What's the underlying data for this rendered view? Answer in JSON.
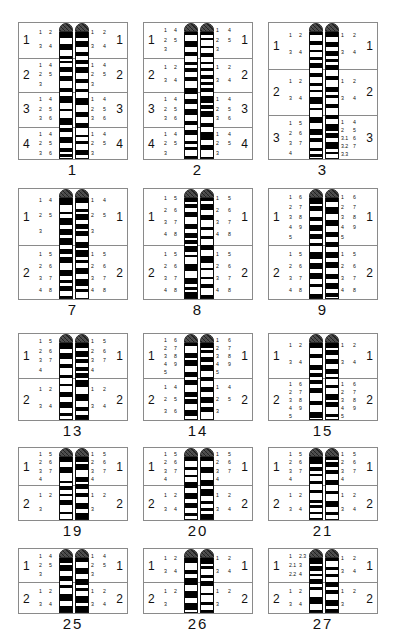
{
  "figure": {
    "type": "karyotype-ideogram-grid",
    "rows": 5,
    "columns": 3,
    "colors": {
      "band_dark": "#000000",
      "band_light": "#ffffff",
      "centromere_cap": "#4a4a4a",
      "panel_border": "#8a8a8a",
      "text": "#111111",
      "background": "#ffffff"
    }
  },
  "chromosomes": [
    {
      "id": "chr1",
      "caption": "1",
      "row": 0,
      "col": 0,
      "regions": [
        "1",
        "2",
        "3",
        "4"
      ],
      "left_band_labels": [
        [
          "1",
          "2",
          "3",
          "4"
        ],
        [
          "1",
          "2",
          "3",
          "4",
          "5"
        ],
        [
          "1",
          "2",
          "3",
          "4",
          "5",
          "6"
        ],
        [
          "1",
          "2",
          "3",
          "4",
          "5",
          "6"
        ]
      ],
      "right_band_labels": [
        [
          "1",
          "2",
          "3",
          "4"
        ],
        [
          "1",
          "2",
          "3",
          "4",
          "5"
        ],
        [
          "1",
          "2",
          "3",
          "4",
          "5",
          "6"
        ],
        [
          "1",
          "2",
          "3",
          "4",
          "5"
        ]
      ]
    },
    {
      "id": "chr2",
      "caption": "2",
      "row": 0,
      "col": 1,
      "regions": [
        "1",
        "2",
        "3",
        "4"
      ],
      "left_band_labels": [
        [
          "1",
          "2",
          "3",
          "4",
          "5"
        ],
        [
          "1",
          "2",
          "3",
          "4"
        ],
        [
          "1",
          "2",
          "3",
          "4",
          "5",
          "6"
        ],
        [
          "1",
          "2",
          "3",
          "4",
          "5"
        ]
      ],
      "right_band_labels": [
        [
          "1",
          "2",
          "3",
          "4",
          "5"
        ],
        [
          "1",
          "2",
          "3",
          "4"
        ],
        [
          "1",
          "2",
          "3",
          "4",
          "5",
          "6"
        ],
        [
          "1",
          "2",
          "3",
          "4",
          "5"
        ]
      ]
    },
    {
      "id": "chr3",
      "caption": "3",
      "row": 0,
      "col": 2,
      "regions": [
        "1",
        "2",
        "3"
      ],
      "left_band_labels": [
        [
          "1",
          "2",
          "3",
          "4"
        ],
        [
          "1",
          "2",
          "3",
          "4"
        ],
        [
          "1",
          "2",
          "3",
          "4",
          "5",
          "6",
          "7"
        ]
      ],
      "right_band_labels": [
        [
          "1",
          "2",
          "3",
          "4"
        ],
        [
          "1",
          "2",
          "3",
          "4"
        ],
        [
          "1",
          "2",
          "3.1",
          "3.2",
          "3.3",
          "4",
          "5",
          "6",
          "7"
        ]
      ]
    },
    {
      "id": "chr7",
      "caption": "7",
      "row": 1,
      "col": 0,
      "regions": [
        "1",
        "2"
      ],
      "left_band_labels": [
        [
          "1",
          "2",
          "3",
          "4",
          "5"
        ],
        [
          "1",
          "2",
          "3",
          "4",
          "5",
          "6",
          "7",
          "8"
        ]
      ],
      "right_band_labels": [
        [
          "1",
          "2",
          "3",
          "4",
          "5"
        ],
        [
          "1",
          "2",
          "3",
          "4",
          "5",
          "6",
          "7",
          "8"
        ]
      ]
    },
    {
      "id": "chr8",
      "caption": "8",
      "row": 1,
      "col": 1,
      "regions": [
        "1",
        "2"
      ],
      "left_band_labels": [
        [
          "1",
          "2",
          "3",
          "4",
          "5",
          "6",
          "7",
          "8"
        ],
        [
          "1",
          "2",
          "3",
          "4",
          "5",
          "6",
          "7",
          "8"
        ]
      ],
      "right_band_labels": [
        [
          "1",
          "2",
          "3",
          "4",
          "5",
          "6",
          "7",
          "8"
        ],
        [
          "1",
          "2",
          "3",
          "4",
          "5",
          "6",
          "7",
          "8"
        ]
      ]
    },
    {
      "id": "chr9",
      "caption": "9",
      "row": 1,
      "col": 2,
      "regions": [
        "1",
        "2"
      ],
      "left_band_labels": [
        [
          "1",
          "2",
          "3",
          "4",
          "5",
          "6",
          "7",
          "8",
          "9"
        ],
        [
          "1",
          "2",
          "3",
          "4",
          "5",
          "6",
          "7",
          "8"
        ]
      ],
      "right_band_labels": [
        [
          "1",
          "2",
          "3",
          "4",
          "5",
          "6",
          "7",
          "8",
          "9"
        ],
        [
          "1",
          "2",
          "3",
          "4",
          "5",
          "6",
          "7",
          "8"
        ]
      ]
    },
    {
      "id": "chr13",
      "caption": "13",
      "row": 2,
      "col": 0,
      "regions": [
        "1",
        "2"
      ],
      "left_band_labels": [
        [
          "1",
          "2",
          "3",
          "4",
          "5",
          "6",
          "7"
        ],
        [
          "1",
          "2",
          "3",
          "4"
        ]
      ],
      "right_band_labels": [
        [
          "1",
          "2",
          "3",
          "4",
          "5",
          "6",
          "7"
        ],
        [
          "1",
          "2",
          "3",
          "4"
        ]
      ]
    },
    {
      "id": "chr14",
      "caption": "14",
      "row": 2,
      "col": 1,
      "regions": [
        "1",
        "2"
      ],
      "left_band_labels": [
        [
          "1",
          "2",
          "3",
          "4",
          "5",
          "6",
          "7",
          "8",
          "9"
        ],
        [
          "1",
          "2",
          "3",
          "4",
          "5",
          "6"
        ]
      ],
      "right_band_labels": [
        [
          "1",
          "2",
          "3",
          "4",
          "5",
          "6",
          "7",
          "8",
          "9"
        ],
        [
          "1",
          "2",
          "3",
          "4",
          "5"
        ]
      ]
    },
    {
      "id": "chr15",
      "caption": "15",
      "row": 2,
      "col": 2,
      "regions": [
        "1",
        "2"
      ],
      "left_band_labels": [
        [
          "1",
          "2",
          "3",
          "4"
        ],
        [
          "1",
          "2",
          "3",
          "4",
          "5",
          "6",
          "7",
          "8",
          "9"
        ]
      ],
      "right_band_labels": [
        [
          "1",
          "2",
          "3",
          "4"
        ],
        [
          "1",
          "2",
          "3",
          "4",
          "5",
          "6",
          "7",
          "8",
          "9"
        ]
      ]
    },
    {
      "id": "chr19",
      "caption": "19",
      "row": 3,
      "col": 0,
      "regions": [
        "1",
        "2"
      ],
      "left_band_labels": [
        [
          "1",
          "2",
          "3",
          "4",
          "5",
          "6",
          "7"
        ],
        [
          "1",
          "2",
          "3"
        ]
      ],
      "right_band_labels": [
        [
          "1",
          "2",
          "3",
          "4",
          "5",
          "6",
          "7"
        ],
        [
          "1",
          "2",
          "3"
        ]
      ]
    },
    {
      "id": "chr20",
      "caption": "20",
      "row": 3,
      "col": 1,
      "regions": [
        "1",
        "2"
      ],
      "left_band_labels": [
        [
          "1",
          "2",
          "3",
          "4",
          "5",
          "6",
          "7"
        ],
        [
          "1",
          "2",
          "3",
          "4"
        ]
      ],
      "right_band_labels": [
        [
          "1",
          "2",
          "3",
          "4",
          "5",
          "6",
          "7"
        ],
        [
          "1",
          "2",
          "3",
          "4"
        ]
      ]
    },
    {
      "id": "chr21",
      "caption": "21",
      "row": 3,
      "col": 2,
      "regions": [
        "1",
        "2"
      ],
      "left_band_labels": [
        [
          "1",
          "2",
          "3",
          "4",
          "5",
          "6",
          "7"
        ],
        [
          "1",
          "2",
          "3",
          "4"
        ]
      ],
      "right_band_labels": [
        [
          "1",
          "2",
          "3",
          "4",
          "5",
          "6",
          "7"
        ],
        [
          "1",
          "2",
          "3",
          "4"
        ]
      ]
    },
    {
      "id": "chr25",
      "caption": "25",
      "row": 4,
      "col": 0,
      "regions": [
        "1",
        "2"
      ],
      "left_band_labels": [
        [
          "1",
          "2",
          "3",
          "4",
          "5"
        ],
        [
          "1",
          "2",
          "3",
          "4"
        ]
      ],
      "right_band_labels": [
        [
          "1",
          "2",
          "3",
          "4",
          "5"
        ],
        [
          "1",
          "2",
          "3",
          "4"
        ]
      ]
    },
    {
      "id": "chr26",
      "caption": "26",
      "row": 4,
      "col": 1,
      "regions": [
        "1",
        "2"
      ],
      "left_band_labels": [
        [
          "1",
          "2",
          "3",
          "4"
        ],
        [
          "1",
          "2",
          "3"
        ]
      ],
      "right_band_labels": [
        [
          "1",
          "2",
          "3",
          "4"
        ],
        [
          "1",
          "2",
          "3"
        ]
      ]
    },
    {
      "id": "chr27",
      "caption": "27",
      "row": 4,
      "col": 2,
      "regions": [
        "1",
        "2"
      ],
      "left_band_labels": [
        [
          "1",
          "2.1",
          "2.2",
          "2.3",
          "3",
          "4"
        ],
        [
          "1",
          "2",
          "3",
          "4"
        ]
      ],
      "right_band_labels": [
        [
          "1",
          "2",
          "3",
          "4"
        ],
        [
          "1",
          "2",
          "3"
        ]
      ]
    }
  ],
  "layout": {
    "rows_top": [
      22,
      188,
      333,
      447,
      548
    ],
    "rows_height": [
      138,
      112,
      88,
      74,
      66
    ],
    "cols_left": [
      18,
      143,
      268
    ],
    "cols_width": [
      110,
      110,
      110
    ]
  }
}
